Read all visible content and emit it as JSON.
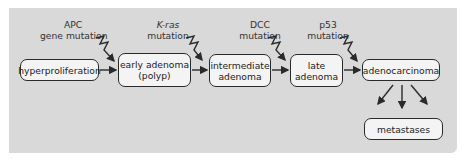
{
  "diagram": {
    "nodes": [
      {
        "id": "hyperproliferation",
        "label": "hyperproliferation"
      },
      {
        "id": "early_adenoma",
        "label_line1": "early adenoma",
        "label_line2": "(polyp)"
      },
      {
        "id": "intermediate_adenoma",
        "label_line1": "intermediate",
        "label_line2": "adenoma"
      },
      {
        "id": "late_adenoma",
        "label_line1": "late",
        "label_line2": "adenoma"
      },
      {
        "id": "adenocarcinoma",
        "label": "adenocarcinoma"
      },
      {
        "id": "metastases",
        "label": "metastases"
      }
    ],
    "mutations": [
      {
        "gene": "APC",
        "line2": "gene mutation"
      },
      {
        "gene": "K-ras",
        "line2": "mutation",
        "italic": true
      },
      {
        "gene": "DCC",
        "line2": "mutation"
      },
      {
        "gene": "p53",
        "line2": "mutation"
      }
    ],
    "colors": {
      "panel": "#d9d9d9",
      "box": "#f4f4f4",
      "stroke": "#2a2a2a"
    }
  }
}
